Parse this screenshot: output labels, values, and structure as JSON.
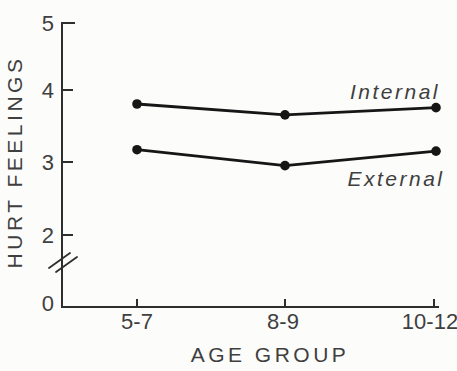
{
  "figure": {
    "background": "#fcfcfb",
    "axis_ink": "#2e2e2e",
    "text_ink": "#3f3f3f",
    "line_ink": "#161616"
  },
  "chart_data": {
    "type": "line",
    "title": "",
    "xlabel": "AGE GROUP",
    "ylabel": "HURT FEELINGS",
    "categories": [
      "5-7",
      "8-9",
      "10-12"
    ],
    "series": [
      {
        "name": "Internal",
        "values": [
          3.8,
          3.65,
          3.75
        ]
      },
      {
        "name": "External",
        "values": [
          3.17,
          2.95,
          3.15
        ]
      }
    ],
    "y_ticks": [
      "5",
      "4",
      "3",
      "2",
      "0"
    ],
    "y_tick_values": [
      5,
      4,
      3,
      2,
      0
    ],
    "ylim": [
      0,
      5
    ],
    "axis_break": true,
    "axis_break_between": [
      0,
      2
    ],
    "grid": "off",
    "legend": "inline-labels",
    "marker": "filled-circle"
  }
}
